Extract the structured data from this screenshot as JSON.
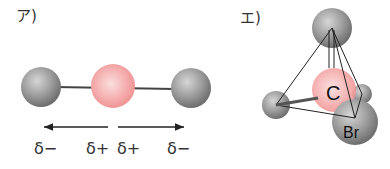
{
  "panels": [
    {
      "label": "ア)",
      "description": "linear molecule with polar bonds",
      "atoms": [
        {
          "role": "outer",
          "color": "#8f8f8f",
          "charge": "δ−"
        },
        {
          "role": "center",
          "color": "#f4a6a6",
          "charge": "δ+"
        },
        {
          "role": "outer",
          "color": "#8f8f8f",
          "charge": "δ−"
        }
      ],
      "dipole_labels": [
        "δ−",
        "δ+",
        "δ+",
        "δ−"
      ]
    },
    {
      "label": "エ)",
      "description": "tetrahedral molecule",
      "center_atom": "C",
      "labeled_atom": "Br"
    }
  ],
  "colors": {
    "atom_gray": "#8f8f8f",
    "atom_pink": "#f4a6a6",
    "ink": "#333333"
  }
}
